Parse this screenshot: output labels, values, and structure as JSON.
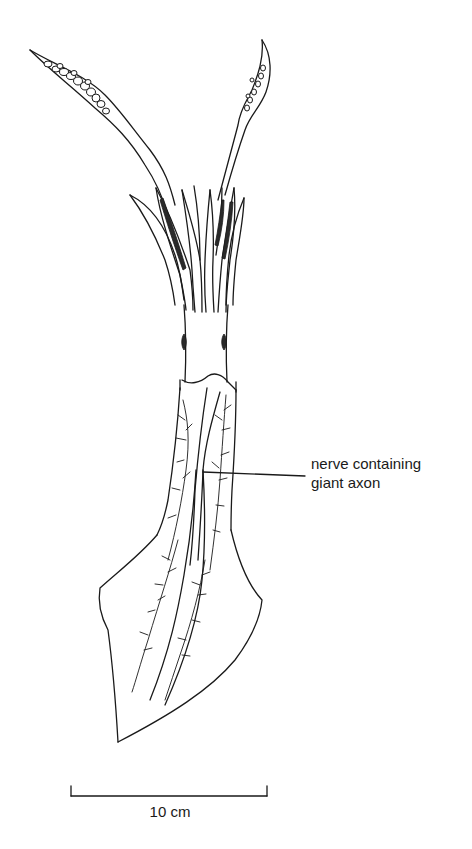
{
  "figure": {
    "annotation": {
      "line1": "nerve containing",
      "line2": "giant axon",
      "leader_line": {
        "x1": 203,
        "y1": 472,
        "x2": 305,
        "y2": 476
      }
    },
    "scale_bar": {
      "label": "10 cm",
      "x1": 71,
      "x2": 267,
      "y": 796,
      "tick_top": 786
    },
    "colors": {
      "ink": "#1a1a1a",
      "background": "#ffffff"
    }
  }
}
